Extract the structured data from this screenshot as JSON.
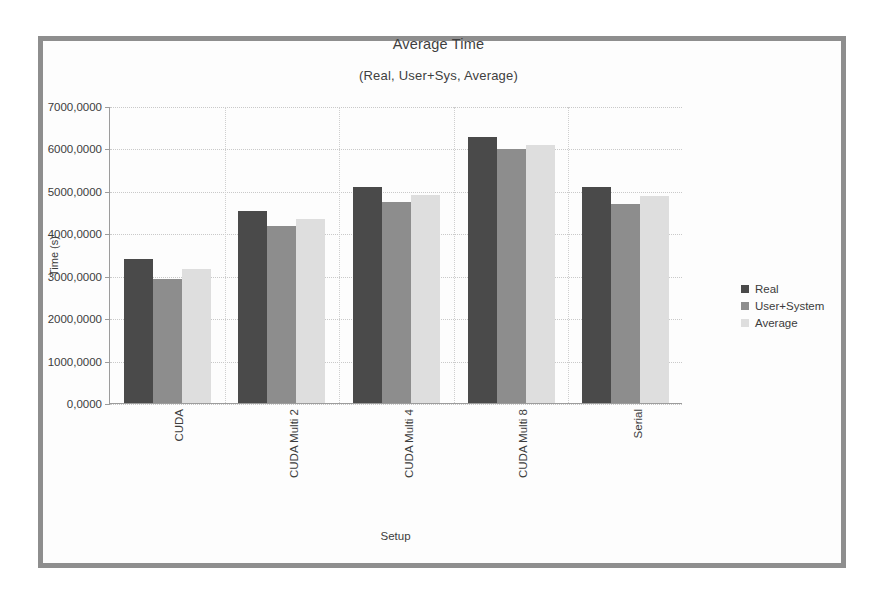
{
  "frame": {
    "border_color": "#8e8e8e"
  },
  "chart_data": {
    "type": "bar",
    "title": "Average Time",
    "subtitle": "(Real, User+Sys, Average)",
    "xlabel": "Setup",
    "ylabel": "Time (s)",
    "categories": [
      "CUDA",
      "CUDA Multi 2",
      "CUDA Multi 4",
      "CUDA Multi 8",
      "Serial"
    ],
    "series": [
      {
        "name": "Real",
        "color": "#4a4a4a",
        "values": [
          3400.0,
          4520.0,
          5090.0,
          6270.0,
          5090.0
        ]
      },
      {
        "name": "User+System",
        "color": "#8d8d8d",
        "values": [
          2930.0,
          4180.0,
          4740.0,
          5980.0,
          4680.0
        ]
      },
      {
        "name": "Average",
        "color": "#dedede",
        "values": [
          3170.0,
          4330.0,
          4900.0,
          6080.0,
          4890.0
        ]
      }
    ],
    "ylim": [
      0,
      7000
    ],
    "ytick_step": 1000,
    "ytick_labels": [
      "0,0000",
      "1000,0000",
      "2000,0000",
      "3000,0000",
      "4000,0000",
      "5000,0000",
      "6000,0000",
      "7000,0000"
    ],
    "ytick_values": [
      0,
      1000,
      2000,
      3000,
      4000,
      5000,
      6000,
      7000
    ],
    "grid": true,
    "legend_position": "right"
  }
}
